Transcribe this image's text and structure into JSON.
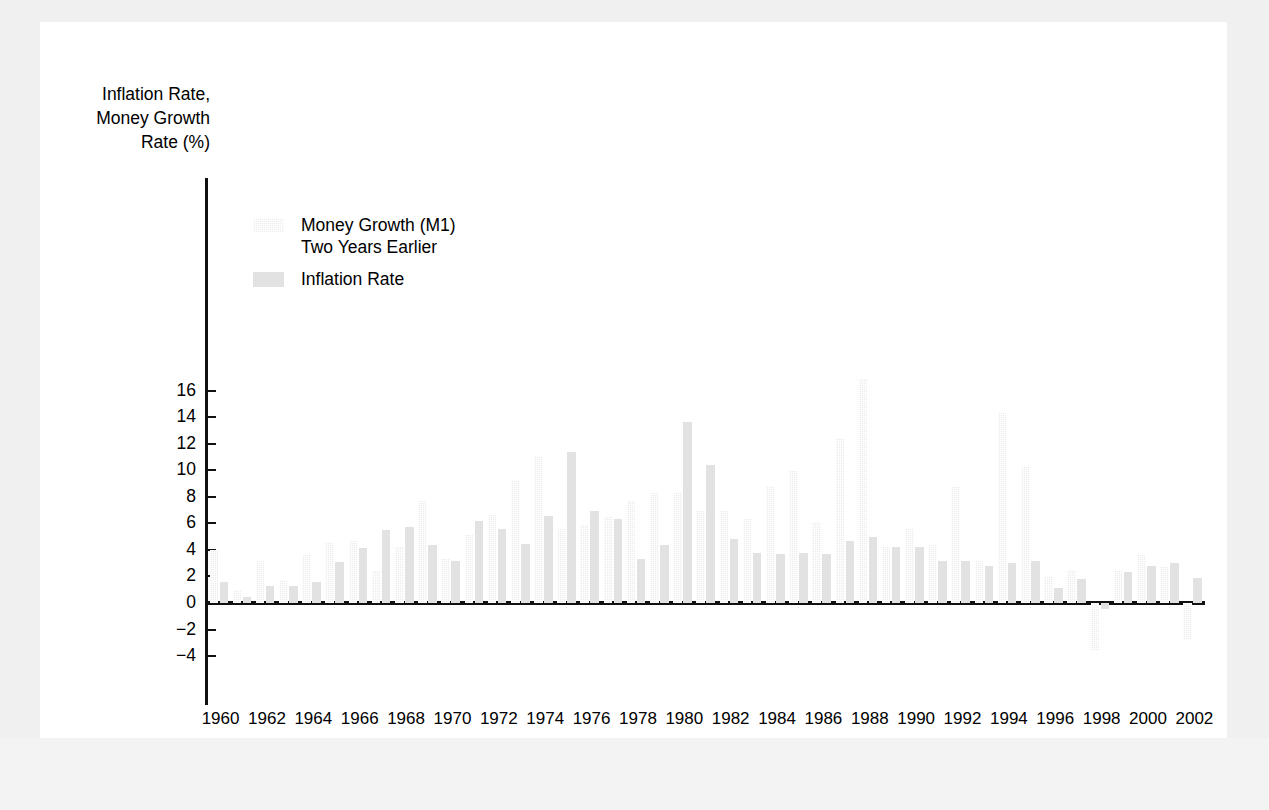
{
  "chart_data": {
    "type": "bar",
    "title": "",
    "ylabel": "Inflation Rate,\nMoney Growth\nRate (%)",
    "xlabel": "",
    "ylim": [
      -4,
      16
    ],
    "yticks": [
      16,
      14,
      12,
      10,
      8,
      6,
      4,
      2,
      0,
      -2,
      -4
    ],
    "ytick_labels": [
      "16",
      "14",
      "12",
      "10",
      "8",
      "6",
      "4",
      "2",
      "0",
      "−2",
      "−4"
    ],
    "grid": false,
    "legend_position": "upper-left-inside",
    "x": [
      1960,
      1961,
      1962,
      1963,
      1964,
      1965,
      1966,
      1967,
      1968,
      1969,
      1970,
      1971,
      1972,
      1973,
      1974,
      1975,
      1976,
      1977,
      1978,
      1979,
      1980,
      1981,
      1982,
      1983,
      1984,
      1985,
      1986,
      1987,
      1988,
      1989,
      1990,
      1991,
      1992,
      1993,
      1994,
      1995,
      1996,
      1997,
      1998,
      1999,
      2000,
      2001,
      2002
    ],
    "xtick_labels": [
      "1960",
      "1962",
      "1964",
      "1966",
      "1968",
      "1970",
      "1972",
      "1974",
      "1976",
      "1978",
      "1980",
      "1982",
      "1984",
      "1986",
      "1988",
      "1990",
      "1992",
      "1994",
      "1996",
      "1998",
      "2000",
      "2002"
    ],
    "series": [
      {
        "name": "Money Growth (M1)\nTwo Years Earlier",
        "swatch": "money",
        "color": "#ececed",
        "pattern": "dotted",
        "values": [
          4.0,
          0.95,
          3.15,
          1.75,
          3.65,
          4.6,
          4.7,
          2.4,
          4.2,
          7.7,
          3.3,
          5.15,
          6.6,
          9.25,
          11.05,
          5.6,
          5.85,
          6.55,
          7.7,
          8.25,
          8.3,
          6.95,
          6.95,
          6.3,
          8.8,
          9.95,
          6.1,
          12.45,
          16.9,
          4.25,
          5.6,
          4.35,
          8.8,
          3.2,
          14.35,
          10.35,
          2.0,
          2.45,
          -3.65,
          2.45,
          3.6,
          2.8,
          -2.75
        ],
        "negative_values_present": true
      },
      {
        "name": "Inflation Rate",
        "swatch": "inflation",
        "color": "#e2e2e2",
        "pattern": "solid",
        "values": [
          1.6,
          0.45,
          1.25,
          1.25,
          1.55,
          3.1,
          4.15,
          5.5,
          5.75,
          4.4,
          3.2,
          6.2,
          5.55,
          4.45,
          6.55,
          11.4,
          6.9,
          6.35,
          3.3,
          4.4,
          13.65,
          10.4,
          4.85,
          3.75,
          3.7,
          3.8,
          3.7,
          4.7,
          5.0,
          4.25,
          4.2,
          3.15,
          3.2,
          2.8,
          3.0,
          3.2,
          1.15,
          1.8,
          -0.45,
          2.35,
          2.8,
          3.0,
          1.85
        ]
      }
    ]
  },
  "legend": {
    "entries": [
      {
        "label": "Money Growth (M1)\nTwo Years Earlier",
        "swatch": "money"
      },
      {
        "label": "Inflation Rate",
        "swatch": "inflation"
      }
    ]
  }
}
